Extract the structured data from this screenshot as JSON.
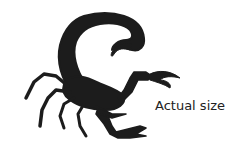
{
  "figure": {
    "fill_color": "#1c1c1c",
    "caption": "Actual size"
  }
}
